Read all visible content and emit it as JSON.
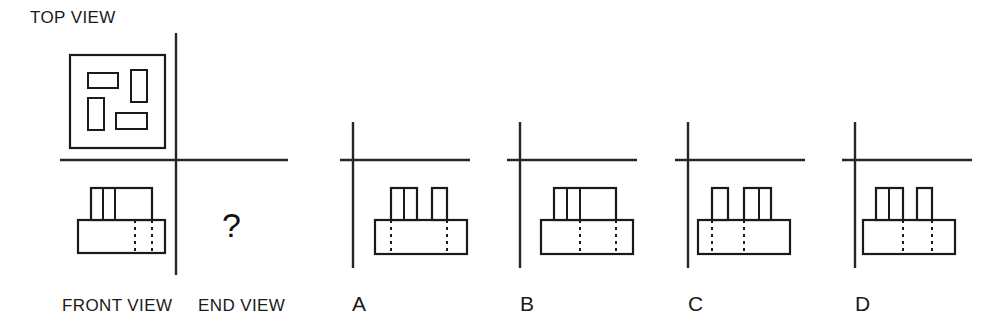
{
  "figure": {
    "type": "orthographic-projection-puzzle",
    "canvas": {
      "width": 990,
      "height": 329,
      "background": "#ffffff"
    },
    "line_color": "#1a1a1a",
    "labels": {
      "top_view": "TOP VIEW",
      "front_view": "FRONT VIEW",
      "end_view": "END VIEW",
      "missing_view": "?"
    },
    "given_views": {
      "top_view": {
        "outline": {
          "x": 70,
          "y": 55,
          "w": 95,
          "h": 93
        },
        "inner_rectangles": [
          {
            "name": "slot-top-left-horizontal",
            "x": 88,
            "y": 73,
            "w": 30,
            "h": 15
          },
          {
            "name": "slot-top-right-vertical",
            "x": 131,
            "y": 70,
            "w": 16,
            "h": 32
          },
          {
            "name": "slot-bottom-left-vertical",
            "x": 88,
            "y": 98,
            "w": 16,
            "h": 32
          },
          {
            "name": "slot-bottom-right-horizontal",
            "x": 116,
            "y": 113,
            "w": 31,
            "h": 16
          }
        ]
      },
      "front_view": {
        "base": {
          "x": 78,
          "y": 220,
          "w": 87,
          "h": 33
        },
        "upper_block": {
          "x": 91,
          "y": 188,
          "w": 61,
          "h": 32
        },
        "upper_dividers_x": [
          103,
          115
        ],
        "base_hidden_lines_x": [
          135,
          152
        ]
      },
      "axis": {
        "vertical_x": 176,
        "vertical_y1": 33,
        "vertical_y2": 275,
        "horizontal_y": 160,
        "horizontal_x1": 60,
        "horizontal_x2": 288
      }
    },
    "options": [
      {
        "id": "A",
        "label": "A",
        "label_x": 352,
        "axis": {
          "vertical_x": 353,
          "vertical_y1": 122,
          "vertical_y2": 268,
          "horizontal_y": 160,
          "horizontal_x1": 340,
          "horizontal_x2": 470
        },
        "base": {
          "x": 375,
          "y": 220,
          "w": 92,
          "h": 34
        },
        "risers": [
          {
            "x": 391,
            "y": 188,
            "w": 26,
            "h": 32,
            "divider_x": 404
          },
          {
            "x": 432,
            "y": 188,
            "w": 15,
            "h": 32,
            "divider_x": null
          }
        ],
        "base_hidden_lines_x": [
          391,
          447
        ]
      },
      {
        "id": "B",
        "label": "B",
        "label_x": 520,
        "axis": {
          "vertical_x": 520,
          "vertical_y1": 122,
          "vertical_y2": 268,
          "horizontal_y": 160,
          "horizontal_x1": 507,
          "horizontal_x2": 637
        },
        "base": {
          "x": 541,
          "y": 220,
          "w": 92,
          "h": 34
        },
        "risers": [
          {
            "x": 554,
            "y": 188,
            "w": 62,
            "h": 32,
            "divider_x": null
          }
        ],
        "riser_dividers_x": [
          567,
          580
        ],
        "base_hidden_lines_x": [
          580,
          616
        ]
      },
      {
        "id": "C",
        "label": "C",
        "label_x": 688,
        "axis": {
          "vertical_x": 688,
          "vertical_y1": 122,
          "vertical_y2": 268,
          "horizontal_y": 160,
          "horizontal_x1": 675,
          "horizontal_x2": 805
        },
        "base": {
          "x": 698,
          "y": 220,
          "w": 92,
          "h": 34
        },
        "risers": [
          {
            "x": 712,
            "y": 188,
            "w": 16,
            "h": 32,
            "divider_x": null
          },
          {
            "x": 744,
            "y": 188,
            "w": 27,
            "h": 32,
            "divider_x": 759
          }
        ],
        "base_hidden_lines_x": [
          712,
          744
        ]
      },
      {
        "id": "D",
        "label": "D",
        "label_x": 855,
        "axis": {
          "vertical_x": 855,
          "vertical_y1": 122,
          "vertical_y2": 268,
          "horizontal_y": 160,
          "horizontal_x1": 842,
          "horizontal_x2": 972
        },
        "base": {
          "x": 863,
          "y": 220,
          "w": 92,
          "h": 34
        },
        "risers": [
          {
            "x": 876,
            "y": 188,
            "w": 27,
            "h": 32,
            "divider_x": 889
          },
          {
            "x": 917,
            "y": 188,
            "w": 15,
            "h": 32,
            "divider_x": null
          }
        ],
        "base_hidden_lines_x": [
          903,
          932
        ]
      }
    ]
  }
}
